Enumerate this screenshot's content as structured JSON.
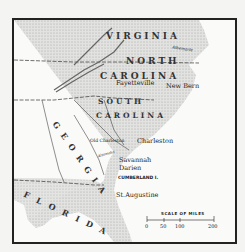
{
  "map": {
    "states": {
      "virginia": "VIRGINIA",
      "north_carolina_1": "NORTH",
      "north_carolina_2": "CAROLINA",
      "south_carolina_1": "SOUTH",
      "south_carolina_2": "CAROLINA",
      "georgia": "GEORGIA",
      "florida": "FLORIDA"
    },
    "cities": {
      "fayetteville": "Fayetteville",
      "new_bern": "New Bern",
      "old_charleston": "Old Charleston",
      "charleston": "Charleston",
      "savannah": "Savannah",
      "darien": "Darien",
      "cumberland": "CUMBERLAND I.",
      "st_augustine": "St.Augustine"
    },
    "rivers": {
      "albemarle": "Albemarle",
      "altamaha": "Altamaha"
    },
    "scale": {
      "title": "SCALE OF MILES",
      "ticks": [
        "0",
        "50",
        "100",
        "200"
      ]
    },
    "colors": {
      "land": "#d8d8d6",
      "water": "#fafaf8",
      "ink": "#222222",
      "mountains": "#777777"
    }
  }
}
